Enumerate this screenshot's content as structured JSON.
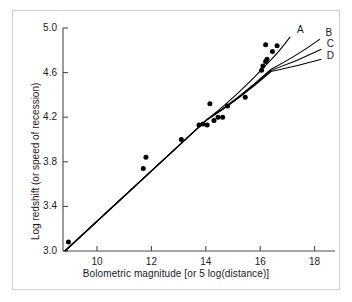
{
  "chart_data": {
    "type": "scatter",
    "title": "",
    "xlabel": "Bolometric magnitude [or 5 log(distance)]",
    "ylabel": "Log redshift (or speed of recession)",
    "xlim": [
      8.75,
      18.75
    ],
    "ylim": [
      3.0,
      5.0
    ],
    "xticks": [
      10,
      12,
      14,
      16,
      18
    ],
    "xtick_labels": [
      "10",
      "12",
      "14",
      "16",
      "18"
    ],
    "yticks": [
      3.0,
      3.4,
      3.8,
      4.2,
      4.6,
      5.0
    ],
    "ytick_labels": [
      "3.0",
      "3.4",
      "3.8",
      "4.2",
      "4.6",
      "5.0"
    ],
    "grid": false,
    "legend_position": "curve-end-labels",
    "marker": "filled-circle",
    "marker_color": "#000000",
    "line_color": "#000000",
    "points": [
      {
        "x": 8.95,
        "y": 3.08
      },
      {
        "x": 11.7,
        "y": 3.74
      },
      {
        "x": 11.8,
        "y": 3.84
      },
      {
        "x": 13.1,
        "y": 4.0
      },
      {
        "x": 13.75,
        "y": 4.13
      },
      {
        "x": 13.9,
        "y": 4.14
      },
      {
        "x": 14.15,
        "y": 4.32
      },
      {
        "x": 14.05,
        "y": 4.13
      },
      {
        "x": 14.3,
        "y": 4.17
      },
      {
        "x": 14.45,
        "y": 4.2
      },
      {
        "x": 14.62,
        "y": 4.2
      },
      {
        "x": 14.8,
        "y": 4.3
      },
      {
        "x": 15.45,
        "y": 4.38
      },
      {
        "x": 16.05,
        "y": 4.62
      },
      {
        "x": 16.1,
        "y": 4.66
      },
      {
        "x": 16.2,
        "y": 4.7
      },
      {
        "x": 16.25,
        "y": 4.72
      },
      {
        "x": 16.2,
        "y": 4.85
      },
      {
        "x": 16.45,
        "y": 4.79
      },
      {
        "x": 16.62,
        "y": 4.84
      }
    ],
    "series": [
      {
        "name": "A",
        "label": "A",
        "label_x": 17.35,
        "label_y": 4.97,
        "points": [
          [
            8.82,
            3.0
          ],
          [
            14.0,
            4.17
          ],
          [
            16.3,
            4.69
          ],
          [
            17.1,
            4.92
          ]
        ]
      },
      {
        "name": "B",
        "label": "B",
        "label_x": 18.4,
        "label_y": 4.95,
        "points": [
          [
            8.82,
            3.0
          ],
          [
            14.0,
            4.17
          ],
          [
            16.4,
            4.63
          ],
          [
            18.2,
            4.9
          ]
        ]
      },
      {
        "name": "C",
        "label": "C",
        "label_x": 18.45,
        "label_y": 4.85,
        "points": [
          [
            8.82,
            3.0
          ],
          [
            14.0,
            4.17
          ],
          [
            16.4,
            4.62
          ],
          [
            18.25,
            4.81
          ]
        ]
      },
      {
        "name": "D",
        "label": "D",
        "label_x": 18.45,
        "label_y": 4.74,
        "points": [
          [
            8.82,
            3.0
          ],
          [
            14.0,
            4.17
          ],
          [
            16.4,
            4.61
          ],
          [
            18.25,
            4.72
          ]
        ]
      }
    ]
  },
  "axis": {
    "x_label": "Bolometric magnitude [or 5 log(distance)]",
    "y_label": "Log redshift (or speed of recession)"
  }
}
